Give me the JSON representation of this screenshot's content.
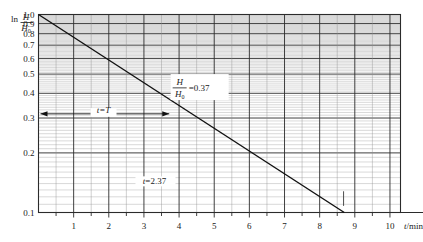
{
  "chart_data": {
    "type": "line",
    "title": "",
    "xlabel": "t/min",
    "ylabel": "ln H/H0",
    "yscale": "log",
    "xscale": "linear",
    "xlim": [
      0,
      10.3
    ],
    "ylim": [
      0.1,
      1.0
    ],
    "grid": true,
    "legend": "none",
    "x_ticks": [
      1,
      2,
      3,
      4,
      5,
      6,
      7,
      8,
      9,
      10
    ],
    "x_tick_labels": [
      "1",
      "2",
      "3",
      "4",
      "5",
      "6",
      "7",
      "8",
      "9",
      "10"
    ],
    "y_ticks": [
      1.0,
      0.9,
      0.8,
      0.7,
      0.6,
      0.5,
      0.4,
      0.3,
      0.2,
      0.1
    ],
    "y_tick_labels": [
      "1.0",
      "0.9",
      "0.8",
      "0.7",
      "0.6",
      "0.5",
      "0.4",
      "0.3",
      "0.2",
      "0.1"
    ],
    "series": [
      {
        "name": "decay-line",
        "x": [
          0,
          8.7
        ],
        "values": [
          1.0,
          0.1
        ]
      }
    ],
    "annotations": [
      {
        "name": "ratio-value",
        "text": "=0.37",
        "numerator": "H",
        "denominator": "H0",
        "x": 4.5,
        "y": 0.43
      },
      {
        "name": "time-constant",
        "text": "t=T",
        "x": 1.85,
        "y": 0.315
      },
      {
        "name": "time-value",
        "text": "t=2.37",
        "x": 3.3,
        "y": 0.142
      }
    ]
  },
  "axis": {
    "y_label_prefix": "ln",
    "y_label_numerator": "H",
    "y_label_denominator": "H0",
    "x_label": "t/min"
  },
  "caption": {
    "text": ""
  }
}
